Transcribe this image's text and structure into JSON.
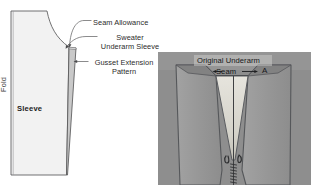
{
  "figure": {
    "background_color": "#ffffff"
  },
  "pattern_diagram": {
    "name": "sleeve-pattern-schematic",
    "fold_label": "Fold",
    "sleeve_label": "Sleeve",
    "pattern_fill": "#f2f2f2",
    "gusset_fill": "#c9c9c9",
    "outline_color": "#58585a",
    "leader_color": "#6d6d6f",
    "callouts": [
      {
        "id": "seam-allowance",
        "label": "Seam Allowance"
      },
      {
        "id": "sweater-underarm-sleeve",
        "label": "Sweater\nUnderarm Sleeve",
        "line1": "Sweater",
        "line2": "Underarm Sleeve"
      },
      {
        "id": "gusset-extension-pattern",
        "label": "Gusset Extension\nPattern",
        "line1": "Gusset Extension",
        "line2": "Pattern"
      }
    ]
  },
  "photo_panel": {
    "name": "garment-photo",
    "background_color": "#8e8e8e",
    "body_fill": "#9b9b9b",
    "gusset_fill": "#d8d6cf",
    "shadow_fill": "#7f7f7f",
    "stitch_color": "#3a3a3c",
    "labels": {
      "original_underarm": "Original Underarm",
      "seam": "Seam",
      "point_a": "A"
    }
  }
}
